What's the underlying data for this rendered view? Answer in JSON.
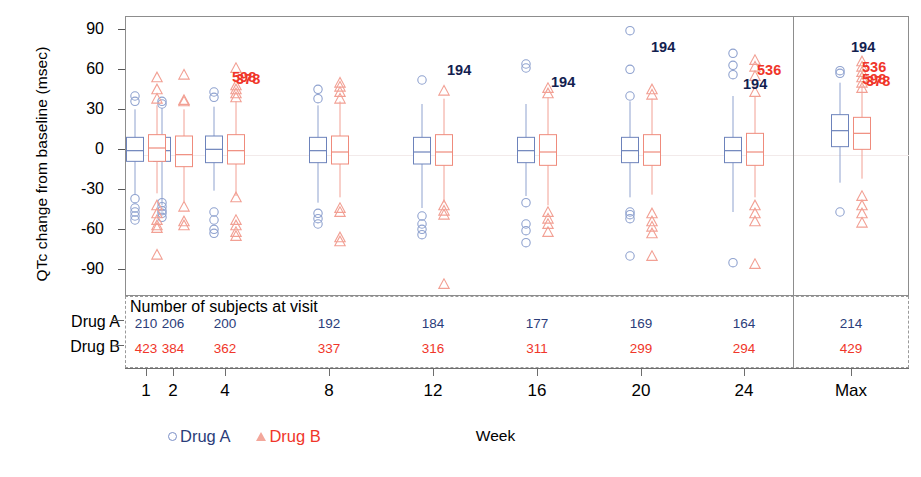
{
  "axes": {
    "ylabel": "QTc change from baseline (msec)",
    "xlabel": "Week",
    "yticks": [
      "90",
      "60",
      "30",
      "0",
      "-30",
      "-60",
      "-90"
    ],
    "xticks": [
      "1",
      "2",
      "4",
      "8",
      "12",
      "16",
      "20",
      "24",
      "Max"
    ]
  },
  "table": {
    "title": "Number of subjects at visit",
    "row_a_label": "Drug A",
    "row_b_label": "Drug B",
    "drug_a_counts": [
      "210",
      "206",
      "200",
      "192",
      "184",
      "177",
      "169",
      "164",
      "214"
    ],
    "drug_b_counts": [
      "423",
      "384",
      "362",
      "337",
      "316",
      "311",
      "299",
      "294",
      "429"
    ]
  },
  "legend": {
    "drug_a": "Drug A",
    "drug_b": "Drug B",
    "drug_a_marker": "circle-marker",
    "drug_b_marker": "triangle-marker"
  },
  "colors": {
    "drug_a": "#2b3d7a",
    "drug_a_light": "#7b8fc7",
    "drug_b": "#f0362a",
    "drug_b_light": "#f3a79b",
    "axis": "#6d6d6d",
    "frame": "#8d8d8d"
  },
  "outlier_labels": [
    {
      "id": "598",
      "series": "b",
      "x": 232,
      "y": 77
    },
    {
      "id": "378",
      "series": "b",
      "x": 236,
      "y": 79
    },
    {
      "id": "194",
      "series": "a",
      "x": 447,
      "y": 70
    },
    {
      "id": "194",
      "series": "a",
      "x": 551,
      "y": 82
    },
    {
      "id": "194",
      "series": "a",
      "x": 651,
      "y": 47
    },
    {
      "id": "194",
      "series": "a",
      "x": 743,
      "y": 84
    },
    {
      "id": "536",
      "series": "b",
      "x": 757,
      "y": 70
    },
    {
      "id": "194",
      "series": "a",
      "x": 851,
      "y": 47
    },
    {
      "id": "536",
      "series": "b",
      "x": 862,
      "y": 67
    },
    {
      "id": "598",
      "series": "b",
      "x": 862,
      "y": 79
    },
    {
      "id": "378",
      "series": "b",
      "x": 866,
      "y": 81
    }
  ],
  "chart_data": {
    "type": "box",
    "title": "",
    "xlabel": "Week",
    "ylabel": "QTc change from baseline (msec)",
    "ylim": [
      -110,
      100
    ],
    "yticks": [
      90,
      60,
      30,
      0,
      -30,
      -60,
      -90
    ],
    "grid": false,
    "legend_position": "bottom",
    "categories": [
      "1",
      "2",
      "4",
      "8",
      "12",
      "16",
      "20",
      "24",
      "Max"
    ],
    "series": [
      {
        "name": "Drug A",
        "color": "#2b3d7a",
        "marker": "circle",
        "boxes": [
          {
            "category": "1",
            "whisker_low": -34,
            "q1": -9,
            "median": -1,
            "q3": 9,
            "whisker_high": 30,
            "n": 210,
            "outliers": [
              36,
              40,
              -37,
              -44,
              -47,
              -50,
              -53
            ]
          },
          {
            "category": "2",
            "whisker_low": -42,
            "q1": -9,
            "median": -1,
            "q3": 9,
            "whisker_high": 31,
            "n": 206,
            "outliers": [
              34,
              36,
              -40,
              -43,
              -46,
              -48,
              -51
            ]
          },
          {
            "category": "4",
            "whisker_low": -31,
            "q1": -10,
            "median": 0,
            "q3": 10,
            "whisker_high": 32,
            "n": 200,
            "outliers": [
              39,
              43,
              -47,
              -53,
              -60,
              -63
            ]
          },
          {
            "category": "8",
            "whisker_low": -40,
            "q1": -10,
            "median": -1,
            "q3": 9,
            "whisker_high": 33,
            "n": 192,
            "outliers": [
              38,
              45,
              -48,
              -52,
              -56
            ]
          },
          {
            "category": "12",
            "whisker_low": -44,
            "q1": -11,
            "median": -2,
            "q3": 9,
            "whisker_high": 34,
            "n": 184,
            "outliers": [
              52,
              -50,
              -56,
              -60,
              -64
            ]
          },
          {
            "category": "16",
            "whisker_low": -35,
            "q1": -10,
            "median": -1,
            "q3": 9,
            "whisker_high": 34,
            "n": 177,
            "outliers": [
              61,
              64,
              -40,
              -56,
              -61,
              -70
            ]
          },
          {
            "category": "20",
            "whisker_low": -36,
            "q1": -10,
            "median": -1,
            "q3": 9,
            "whisker_high": 36,
            "n": 169,
            "outliers": [
              89,
              60,
              40,
              -47,
              -49,
              -52,
              -80
            ]
          },
          {
            "category": "24",
            "whisker_low": -47,
            "q1": -10,
            "median": -1,
            "q3": 9,
            "whisker_high": 40,
            "n": 164,
            "outliers": [
              72,
              63,
              56,
              -85
            ]
          },
          {
            "category": "Max",
            "whisker_low": -25,
            "q1": 2,
            "median": 14,
            "q3": 26,
            "whisker_high": 50,
            "n": 214,
            "outliers": [
              57,
              59,
              -47
            ]
          }
        ]
      },
      {
        "name": "Drug B",
        "color": "#f0362a",
        "marker": "triangle",
        "boxes": [
          {
            "category": "1",
            "whisker_low": -33,
            "q1": -9,
            "median": 1,
            "q3": 11,
            "whisker_high": 33,
            "n": 423,
            "outliers": [
              54,
              45,
              38,
              -42,
              -48,
              -53,
              -57,
              -59,
              -79
            ]
          },
          {
            "category": "2",
            "whisker_low": -39,
            "q1": -13,
            "median": -4,
            "q3": 10,
            "whisker_high": 30,
            "n": 384,
            "outliers": [
              56,
              37,
              36,
              -43,
              -54,
              -57
            ]
          },
          {
            "category": "4",
            "whisker_low": -35,
            "q1": -11,
            "median": -1,
            "q3": 11,
            "whisker_high": 36,
            "n": 362,
            "outliers": [
              61,
              48,
              45,
              42,
              39,
              -36,
              -53,
              -57,
              -62,
              -65
            ]
          },
          {
            "category": "8",
            "whisker_low": -36,
            "q1": -11,
            "median": -2,
            "q3": 10,
            "whisker_high": 36,
            "n": 337,
            "outliers": [
              50,
              47,
              43,
              38,
              -44,
              -47,
              -66,
              -69
            ]
          },
          {
            "category": "12",
            "whisker_low": -40,
            "q1": -12,
            "median": -2,
            "q3": 11,
            "whisker_high": 38,
            "n": 316,
            "outliers": [
              44,
              -42,
              -46,
              -49,
              -101
            ]
          },
          {
            "category": "16",
            "whisker_low": -42,
            "q1": -12,
            "median": -2,
            "q3": 11,
            "whisker_high": 39,
            "n": 311,
            "outliers": [
              46,
              42,
              -47,
              -52,
              -56,
              -62
            ]
          },
          {
            "category": "20",
            "whisker_low": -34,
            "q1": -12,
            "median": -2,
            "q3": 11,
            "whisker_high": 38,
            "n": 299,
            "outliers": [
              45,
              41,
              -48,
              -54,
              -58,
              -63,
              -80
            ]
          },
          {
            "category": "24",
            "whisker_low": -36,
            "q1": -12,
            "median": -2,
            "q3": 12,
            "whisker_high": 40,
            "n": 294,
            "outliers": [
              67,
              62,
              55,
              43,
              -42,
              -48,
              -54,
              -86
            ]
          },
          {
            "category": "Max",
            "whisker_low": -22,
            "q1": 0,
            "median": 12,
            "q3": 24,
            "whisker_high": 48,
            "n": 429,
            "outliers": [
              66,
              62,
              58,
              54,
              50,
              46,
              -35,
              -42,
              -48,
              -55
            ]
          }
        ]
      }
    ]
  }
}
